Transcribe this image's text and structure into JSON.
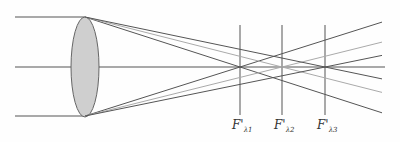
{
  "diagram": {
    "colors": {
      "ray": "#555555",
      "ray_light": "#a8a8a8",
      "lens_fill": "#cfcfcf",
      "lens_stroke": "#666666",
      "focal_line": "#555555"
    },
    "lens": {
      "cx": 85,
      "cy": 67,
      "rx": 14,
      "ry": 50
    },
    "axis": {
      "x1": 15,
      "x2": 385,
      "y": 67
    },
    "incident_rays": [
      {
        "name": "top-ray",
        "x1": 15,
        "x2": 85,
        "y": 17
      },
      {
        "name": "axis-ray",
        "x1": 15,
        "x2": 85,
        "y": 67
      },
      {
        "name": "bottom-ray",
        "x1": 15,
        "x2": 85,
        "y": 116
      }
    ],
    "focal_points": [
      {
        "id": "lambda1",
        "x": 240,
        "label_main": "F'",
        "label_sub": "λ1"
      },
      {
        "id": "lambda2",
        "x": 282,
        "label_main": "F'",
        "label_sub": "λ2"
      },
      {
        "id": "lambda3",
        "x": 325,
        "label_main": "F'",
        "label_sub": "λ3"
      }
    ],
    "focal_line_range": {
      "y1": 25,
      "y2": 115
    },
    "ray_end_x": 382
  }
}
